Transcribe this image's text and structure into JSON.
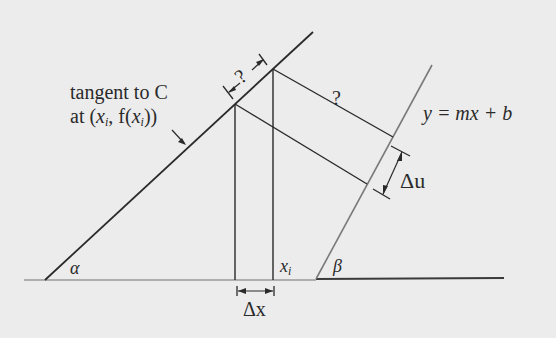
{
  "diagram": {
    "labels": {
      "tangent_line1": "tangent to C",
      "tangent_line2_prefix": "at (",
      "tangent_x": "x",
      "tangent_sub": "i",
      "tangent_mid": ", f(",
      "tangent_x2": "x",
      "tangent_sub2": "i",
      "tangent_suffix": "))",
      "line_equation": "y = mx + b",
      "delta_u": "Δu",
      "delta_x": "Δx",
      "x_i_base": "x",
      "x_i_sub": "i",
      "alpha": "α",
      "beta": "β",
      "unknown_along_tangent": "?",
      "unknown_perpendicular": "?"
    },
    "colors": {
      "background": "#ececec",
      "line_dark": "#2a2a2a",
      "line_gray": "#7a7a7a"
    }
  }
}
